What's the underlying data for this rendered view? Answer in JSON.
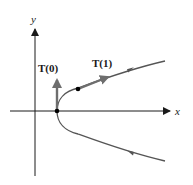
{
  "figure": {
    "colors": {
      "axis": "#1a1a1a",
      "curve": "#555555",
      "vector": "#6e6e6e",
      "point": "#000000"
    },
    "axes": {
      "x_label": "x",
      "y_label": "y"
    },
    "vectors": [
      {
        "label": "T(0)",
        "at_point": "vertex",
        "direction": "up"
      },
      {
        "label": "T(1)",
        "at_point": "t=1",
        "direction": "along curve"
      }
    ],
    "points": [
      {
        "name": "vertex"
      },
      {
        "name": "t=1"
      }
    ],
    "orientation_arrows": [
      {
        "branch": "upper",
        "direction": "right"
      },
      {
        "branch": "lower",
        "direction": "left"
      }
    ]
  }
}
